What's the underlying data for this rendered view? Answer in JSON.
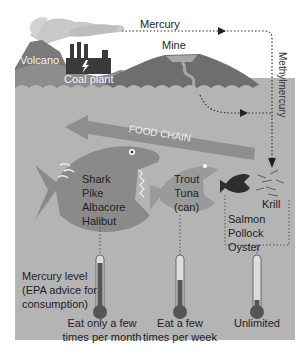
{
  "diagram": {
    "sources": {
      "volcano": "Volcano",
      "coal_plant": "Coal plant",
      "mine": "Mine"
    },
    "flows": {
      "mercury": "Mercury",
      "methylmercury": "Methylmercury",
      "food_chain": "FOOD CHAIN"
    },
    "fish_groups": [
      {
        "id": "large",
        "species": [
          "Shark",
          "Pike",
          "Albacore",
          "Halibut"
        ]
      },
      {
        "id": "medium",
        "species": [
          "Trout",
          "Tuna",
          "(can)"
        ]
      },
      {
        "id": "small",
        "species": [
          "Salmon",
          "Pollock",
          "Oyster"
        ]
      },
      {
        "id": "base",
        "species": [
          "Krill"
        ]
      }
    ],
    "legend": {
      "label_lines": [
        "Mercury level",
        "(EPA advice for",
        "consumption)"
      ]
    },
    "thermometers": [
      {
        "level": "high",
        "fill_pct": 85,
        "advice_lines": [
          "Eat only a few",
          "times per month"
        ]
      },
      {
        "level": "medium",
        "fill_pct": 55,
        "advice_lines": [
          "Eat a few",
          "times per week"
        ]
      },
      {
        "level": "low",
        "fill_pct": 15,
        "advice_lines": [
          "Unlimited"
        ]
      }
    ],
    "colors": {
      "background": "#ffffff",
      "water": "#b4b4b4",
      "land_dark": "#7a7a7a",
      "land_mid": "#8c8c8c",
      "smoke": "#c8c8c8",
      "factory": "#3a3a3a",
      "big_fish": "#8a8a8a",
      "mid_fish": "#9a9a9a",
      "small_fish": "#2e2e2e",
      "arrow": "#8e8e8e",
      "thermo_fill": "#555555"
    }
  }
}
